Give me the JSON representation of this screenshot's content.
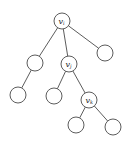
{
  "diagram": {
    "type": "tree",
    "stroke_color": "#4a4a4a",
    "node_radius": 8,
    "nodes": [
      {
        "id": "vi",
        "label": "v",
        "sub": "i",
        "x": 62,
        "y": 21
      },
      {
        "id": "a",
        "label": "",
        "sub": "",
        "x": 35,
        "y": 63
      },
      {
        "id": "vj",
        "label": "v",
        "sub": "j",
        "x": 69,
        "y": 64
      },
      {
        "id": "c",
        "label": "",
        "sub": "",
        "x": 105,
        "y": 53
      },
      {
        "id": "a1",
        "label": "",
        "sub": "",
        "x": 18,
        "y": 95
      },
      {
        "id": "vj1",
        "label": "",
        "sub": "",
        "x": 54,
        "y": 96
      },
      {
        "id": "vk",
        "label": "v",
        "sub": "k",
        "x": 89,
        "y": 100
      },
      {
        "id": "vk1",
        "label": "",
        "sub": "",
        "x": 76,
        "y": 125
      },
      {
        "id": "vk2",
        "label": "",
        "sub": "",
        "x": 113,
        "y": 127
      }
    ],
    "edges": [
      [
        "vi",
        "a"
      ],
      [
        "vi",
        "vj"
      ],
      [
        "vi",
        "c"
      ],
      [
        "a",
        "a1"
      ],
      [
        "vj",
        "vj1"
      ],
      [
        "vj",
        "vk"
      ],
      [
        "vk",
        "vk1"
      ],
      [
        "vk",
        "vk2"
      ]
    ]
  }
}
